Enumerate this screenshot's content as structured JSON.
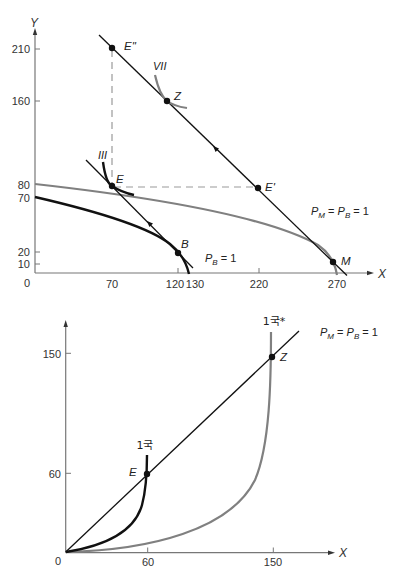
{
  "figure_top": {
    "axis_labels": {
      "x": "X",
      "y": "Y"
    },
    "origin_label": "0",
    "y_ticks": [
      "210",
      "160",
      "80",
      "70",
      "20",
      "10"
    ],
    "x_ticks": [
      "70",
      "120",
      "130",
      "220",
      "270"
    ],
    "points": [
      {
        "label": "E''",
        "x": 70,
        "y": 210
      },
      {
        "label": "Z",
        "y": 160
      },
      {
        "label": "E",
        "x": 70,
        "y": 80
      },
      {
        "label": "E'",
        "x": 220,
        "y": 80
      },
      {
        "label": "B",
        "x": 120,
        "y": 20
      },
      {
        "label": "M",
        "x": 270,
        "y": 10
      }
    ],
    "curve_labels": {
      "indifference_high": "VII",
      "indifference_low": "III"
    },
    "price_world": {
      "p1": "P",
      "s1": "M",
      "eq1": " = ",
      "p2": "P",
      "s2": "B",
      "eq2": " = 1"
    },
    "price_home": {
      "p1": "P",
      "s1": "B",
      "eq1": " = 1"
    },
    "ppf": {
      "home_intercepts": {
        "y": 70,
        "x": 130
      },
      "trade_intercepts": {
        "y": 80,
        "x": 270
      }
    }
  },
  "figure_bottom": {
    "axis_labels": {
      "x": "X"
    },
    "origin_label": "0",
    "y_ticks": [
      "150",
      "60"
    ],
    "x_ticks": [
      "60",
      "150"
    ],
    "points": [
      {
        "label": "E",
        "x": 60,
        "y": 60
      },
      {
        "label": "Z",
        "x": 150,
        "y": 150
      }
    ],
    "curve_labels": {
      "country_1": "1국",
      "country_1_star": "1국*"
    },
    "price": {
      "p1": "P",
      "s1": "M",
      "eq1": " = ",
      "p2": "P",
      "s2": "B",
      "eq2": " = 1"
    }
  }
}
